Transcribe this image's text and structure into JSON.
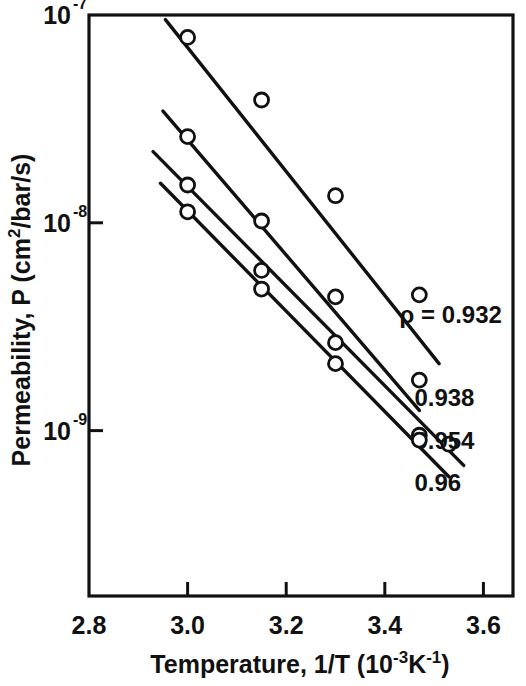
{
  "chart_data": {
    "type": "line",
    "title": "",
    "xlabel": "Temperature, 1/T  (10-3K-1)",
    "xlabel_parts": {
      "main": "Temperature, 1/T  (10",
      "exp1": "-3",
      "mid": "K",
      "exp2": "-1",
      "tail": ")"
    },
    "ylabel": "Permeability,  P  (cm2/bar/s)",
    "ylabel_parts": {
      "main": "Permeability,  P  (cm",
      "exp": "2",
      "tail": "/bar/s)"
    },
    "xlim": [
      2.8,
      3.66
    ],
    "ylim": [
      1.6e-10,
      1e-07
    ],
    "yscale": "log",
    "xscale": "linear",
    "grid": false,
    "legend_position": "inline-right",
    "xticks": [
      2.8,
      3.0,
      3.2,
      3.4,
      3.6
    ],
    "xticklabels": [
      "2.8",
      "3.0",
      "3.2",
      "3.4",
      "3.6"
    ],
    "yticks": [
      1e-07,
      1e-08,
      1e-09
    ],
    "yticklabels": [
      {
        "mantissa": "10",
        "exponent": "-7"
      },
      {
        "mantissa": "10",
        "exponent": "-8"
      },
      {
        "mantissa": "10",
        "exponent": "-9"
      }
    ],
    "marker": "open-circle",
    "series": [
      {
        "name": "rho = 0.932",
        "label": "ρ = 0.932",
        "label_x": 3.43,
        "label_y": 3.3e-09,
        "line_start": [
          2.955,
          9.5e-08
        ],
        "line_end": [
          3.51,
          2.1e-09
        ],
        "x": [
          3.0,
          3.15,
          3.3,
          3.47
        ],
        "y": [
          7.8e-08,
          3.9e-08,
          1.35e-08,
          4.5e-09
        ]
      },
      {
        "name": "rho = 0.938",
        "label": "0.938",
        "label_x": 3.46,
        "label_y": 1.32e-09,
        "line_start": [
          2.95,
          3.45e-08
        ],
        "line_end": [
          3.47,
          1.25e-09
        ],
        "x": [
          3.0,
          3.15,
          3.3,
          3.47
        ],
        "y": [
          2.6e-08,
          1.02e-08,
          4.4e-09,
          1.75e-09
        ]
      },
      {
        "name": "rho = 0.954",
        "label": "0.954",
        "label_x": 3.46,
        "label_y": 8.2e-10,
        "line_start": [
          2.93,
          2.2e-08
        ],
        "line_end": [
          3.56,
          6.8e-10
        ],
        "x": [
          3.0,
          3.15,
          3.3,
          3.47,
          3.53
        ],
        "y": [
          1.52e-08,
          5.9e-09,
          2.65e-09,
          9.5e-10,
          8.6e-10
        ]
      },
      {
        "name": "rho = 0.96",
        "label": "0.96",
        "label_x": 3.46,
        "label_y": 5.1e-10,
        "line_start": [
          2.945,
          1.55e-08
        ],
        "line_end": [
          3.53,
          6e-10
        ],
        "x": [
          3.0,
          3.15,
          3.3,
          3.47
        ],
        "y": [
          1.13e-08,
          4.8e-09,
          2.1e-09,
          9e-10
        ]
      }
    ]
  },
  "style": {
    "axis_color": "#111111",
    "line_color": "#111111",
    "marker_face": "#ffffff",
    "background": "#ffffff"
  }
}
